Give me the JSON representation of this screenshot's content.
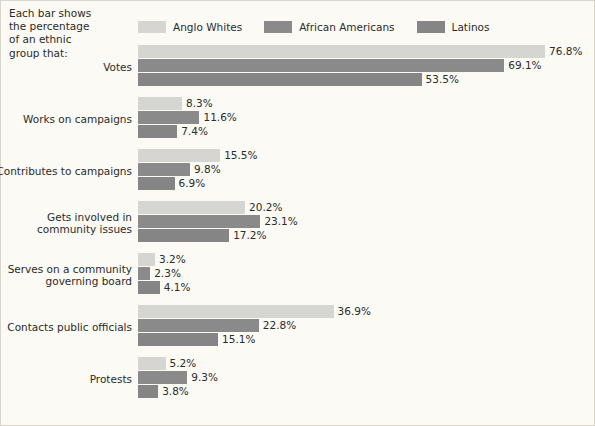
{
  "note": {
    "lines": [
      "Each bar shows",
      "the percentage",
      "of an ethnic",
      "group that:"
    ]
  },
  "legend": {
    "items": [
      {
        "label": "Anglo Whites",
        "color": "#d5d5d2"
      },
      {
        "label": "African Americans",
        "color": "#8a8a8a"
      },
      {
        "label": "Latinos",
        "color": "#858585"
      }
    ]
  },
  "chart_data": {
    "type": "bar",
    "orientation": "horizontal",
    "title": "",
    "xlabel": "",
    "ylabel": "",
    "xlim": [
      0,
      80
    ],
    "grid": false,
    "legend_position": "top",
    "value_suffix": "%",
    "categories": [
      "Votes",
      "Works on campaigns",
      "Contributes to campaigns",
      "Gets involved in\ncommunity issues",
      "Serves on a community\ngoverning board",
      "Contacts public officials",
      "Protests"
    ],
    "category_lines": [
      [
        "Votes"
      ],
      [
        "Works on campaigns"
      ],
      [
        "Contributes to campaigns"
      ],
      [
        "Gets involved in",
        "community issues"
      ],
      [
        "Serves on a community",
        "governing board"
      ],
      [
        "Contacts public officials"
      ],
      [
        "Protests"
      ]
    ],
    "series": [
      {
        "name": "Anglo Whites",
        "color": "#d5d5d2",
        "values": [
          76.8,
          8.3,
          15.5,
          20.2,
          3.2,
          36.9,
          5.2
        ],
        "labels": [
          "76.8%",
          "8.3%",
          "15.5%",
          "20.2%",
          "3.2%",
          "36.9%",
          "5.2%"
        ]
      },
      {
        "name": "African Americans",
        "color": "#8a8a8a",
        "values": [
          69.1,
          11.6,
          9.8,
          23.1,
          2.3,
          22.8,
          9.3
        ],
        "labels": [
          "69.1%",
          "11.6%",
          "9.8%",
          "23.1%",
          "2.3%",
          "22.8%",
          "9.3%"
        ]
      },
      {
        "name": "Latinos",
        "color": "#858585",
        "values": [
          53.5,
          7.4,
          6.9,
          17.2,
          4.1,
          15.1,
          3.8
        ],
        "labels": [
          "53.5%",
          "7.4%",
          "6.9%",
          "17.2%",
          "4.1%",
          "15.1%",
          "3.8%"
        ]
      }
    ]
  },
  "layout": {
    "px_per_unit": 5.3,
    "group_height": 52,
    "group_top_start": 0,
    "background": "#fbfaf5",
    "border_color": "#d8d5cc"
  }
}
